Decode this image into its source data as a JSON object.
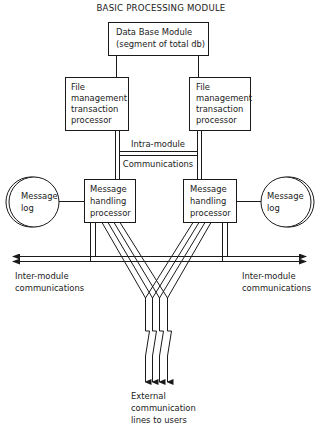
{
  "title": "BASIC PROCESSING MODULE",
  "database": {
    "line1": "Data Base Module",
    "line2": "(segment of total db)"
  },
  "file_processors": {
    "left": {
      "line1": "File",
      "line2": "management",
      "line3": "transaction",
      "line4": "processor"
    },
    "right": {
      "line1": "File",
      "line2": "management",
      "line3": "transaction",
      "line4": "processor"
    }
  },
  "intra_module": {
    "line1": "Intra-module",
    "line2": "Communications"
  },
  "message_handlers": {
    "left": {
      "line1": "Message",
      "line2": "handling",
      "line3": "processor"
    },
    "right": {
      "line1": "Message",
      "line2": "handling",
      "line3": "processor"
    }
  },
  "message_logs": {
    "left": {
      "line1": "Message",
      "line2": "log"
    },
    "right": {
      "line1": "Message",
      "line2": "log"
    }
  },
  "inter_module": {
    "left": {
      "line1": "Inter-module",
      "line2": "communications"
    },
    "right": {
      "line1": "Inter-module",
      "line2": "communications"
    }
  },
  "external": {
    "line1": "External",
    "line2": "communication",
    "line3": "lines to users"
  },
  "colors": {
    "ink": "#1a1a1a",
    "background": "#ffffff"
  }
}
